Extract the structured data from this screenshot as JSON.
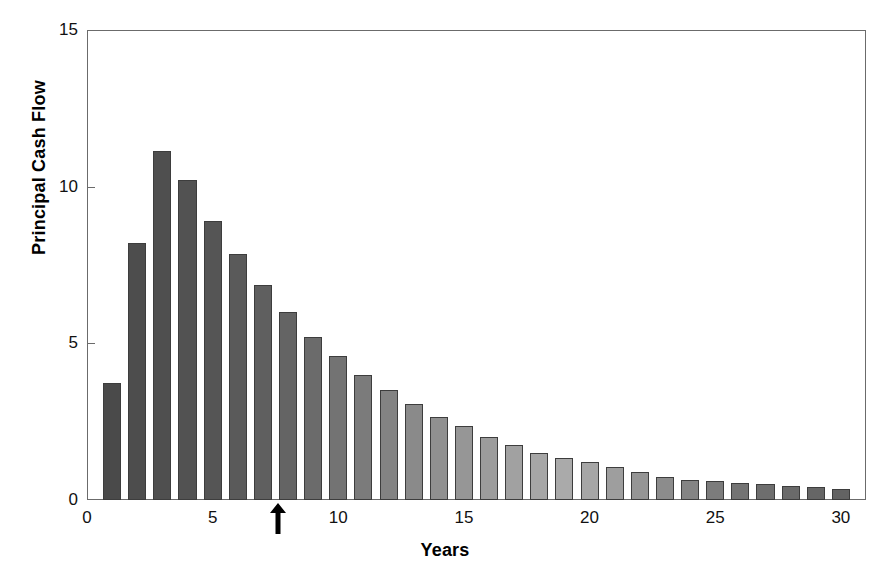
{
  "chart_data": {
    "type": "bar",
    "title": "",
    "xlabel": "Years",
    "ylabel": "Principal Cash Flow",
    "xlim": [
      0,
      31
    ],
    "ylim": [
      0,
      15
    ],
    "grid": false,
    "legend": null,
    "x_ticks": [
      "0",
      "5",
      "10",
      "15",
      "20",
      "25",
      "30"
    ],
    "x_tick_values": [
      0,
      5,
      10,
      15,
      20,
      25,
      30
    ],
    "y_ticks": [
      "0",
      "5",
      "10",
      "15"
    ],
    "y_tick_values": [
      0,
      5,
      10,
      15
    ],
    "categories": [
      1,
      2,
      3,
      4,
      5,
      6,
      7,
      8,
      9,
      10,
      11,
      12,
      13,
      14,
      15,
      16,
      17,
      18,
      19,
      20,
      21,
      22,
      23,
      24,
      25,
      26,
      27,
      28,
      29,
      30
    ],
    "values": [
      3.75,
      8.2,
      11.15,
      10.2,
      8.9,
      7.85,
      6.85,
      6.0,
      5.2,
      4.6,
      4.0,
      3.5,
      3.05,
      2.65,
      2.35,
      2.0,
      1.75,
      1.5,
      1.35,
      1.2,
      1.05,
      0.9,
      0.75,
      0.65,
      0.6,
      0.55,
      0.5,
      0.45,
      0.4,
      0.35
    ],
    "bar_colors": [
      "#4a4a4a",
      "#4d4d4d",
      "#4f4f4f",
      "#525252",
      "#555555",
      "#5a5a5a",
      "#5f5f5f",
      "#646464",
      "#6b6b6b",
      "#737373",
      "#7b7b7b",
      "#838383",
      "#8a8a8a",
      "#909090",
      "#969696",
      "#9c9c9c",
      "#a1a1a1",
      "#a6a6a6",
      "#aaaaaa",
      "#a6a6a6",
      "#9e9e9e",
      "#959595",
      "#8c8c8c",
      "#848484",
      "#7c7c7c",
      "#747474",
      "#6e6e6e",
      "#6a6a6a",
      "#666666",
      "#636363"
    ],
    "annotations": [
      {
        "name": "arrow-marker",
        "glyph": "up-arrow",
        "x_value": 7.6,
        "description": "upward arrow marker on x-axis between years 7 and 8"
      }
    ]
  },
  "axes": {
    "frame_color": "#6b6b6b",
    "y_title": "Principal Cash Flow",
    "x_title": "Years"
  }
}
